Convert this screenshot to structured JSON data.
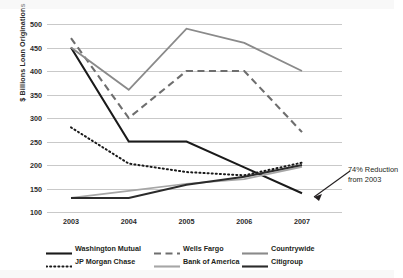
{
  "chart_data": {
    "type": "line",
    "title": "",
    "subtitle": "",
    "xlabel": "",
    "ylabel": "$ Billions Loan Originations",
    "categories": [
      "2003",
      "2004",
      "2005",
      "2006",
      "2007"
    ],
    "x": [
      2003,
      2004,
      2005,
      2006,
      2007
    ],
    "ylim": [
      100,
      500
    ],
    "ytick_values": [
      100,
      150,
      200,
      250,
      300,
      350,
      400,
      450,
      500
    ],
    "ytick_labels": [
      "100",
      "150",
      "200",
      "250",
      "300",
      "350",
      "400",
      "450",
      "500"
    ],
    "grid": true,
    "grid_axis": "y",
    "legend_position": "bottom",
    "series": [
      {
        "name": "Washington Mutual",
        "style": "solid",
        "color": "#1a1a1a",
        "width": 2.1,
        "values": [
          450,
          250,
          250,
          195,
          140
        ]
      },
      {
        "name": "Wells Fargo",
        "style": "long-dashed",
        "color": "#6e6e6e",
        "width": 2.1,
        "values": [
          470,
          300,
          400,
          400,
          270
        ]
      },
      {
        "name": "Countrywide",
        "style": "solid",
        "color": "#8a8a8a",
        "width": 1.9,
        "values": [
          450,
          360,
          490,
          460,
          400
        ]
      },
      {
        "name": "JP Morgan Chase",
        "style": "dotted",
        "color": "#1a1a1a",
        "width": 2.0,
        "values": [
          280,
          203,
          185,
          178,
          205
        ]
      },
      {
        "name": "Bank of America",
        "style": "solid",
        "color": "#a6a6a6",
        "width": 1.6,
        "values": [
          130,
          145,
          160,
          170,
          196
        ]
      },
      {
        "name": "Citigroup",
        "style": "solid",
        "color": "#2b2b2b",
        "width": 2.0,
        "values": [
          130,
          130,
          158,
          175,
          200
        ]
      }
    ],
    "annotations": [
      {
        "name": "reduction-callout",
        "text_line_1": "74% Reduction",
        "text_line_2": "from 2003",
        "points_to_series": "Washington Mutual",
        "points_to_x": "2007",
        "points_to_value": 140
      }
    ]
  },
  "legend": {
    "rows": [
      [
        {
          "label": "Washington Mutual",
          "style": "solid",
          "color": "#1a1a1a"
        },
        {
          "label": "Wells Fargo",
          "style": "long-dashed",
          "color": "#6e6e6e"
        },
        {
          "label": "Countrywide",
          "style": "solid",
          "color": "#8a8a8a"
        }
      ],
      [
        {
          "label": "JP Morgan Chase",
          "style": "dotted",
          "color": "#1a1a1a"
        },
        {
          "label": "Bank of America",
          "style": "solid",
          "color": "#a6a6a6"
        },
        {
          "label": "Citigroup",
          "style": "solid",
          "color": "#2b2b2b"
        }
      ]
    ]
  }
}
